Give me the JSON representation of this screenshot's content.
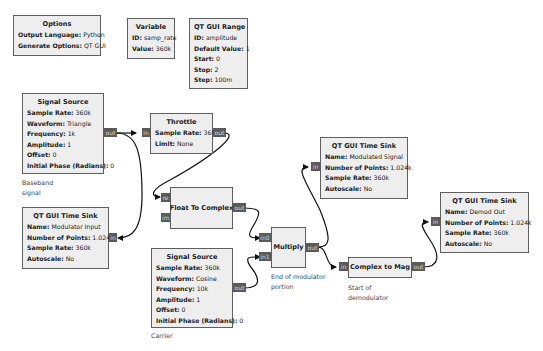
{
  "blocks": {
    "options": {
      "title": "Options",
      "params": [
        {
          "k": "Output Language:",
          "v": "Python"
        },
        {
          "k": "Generate Options:",
          "v": "QT GUI"
        }
      ]
    },
    "variable": {
      "title": "Variable",
      "params": [
        {
          "k": "ID:",
          "v": "samp_rate"
        },
        {
          "k": "Value:",
          "v": "360k"
        }
      ]
    },
    "qt_gui_range": {
      "title": "QT GUI Range",
      "params": [
        {
          "k": "ID:",
          "v": "amplitude"
        },
        {
          "k": "Default Value:",
          "v": "1"
        },
        {
          "k": "Start:",
          "v": "0"
        },
        {
          "k": "Stop:",
          "v": "2"
        },
        {
          "k": "Step:",
          "v": "100m"
        }
      ]
    },
    "signal_source_baseband": {
      "title": "Signal Source",
      "params": [
        {
          "k": "Sample Rate:",
          "v": "360k"
        },
        {
          "k": "Waveform:",
          "v": "Triangle"
        },
        {
          "k": "Frequency:",
          "v": "1k"
        },
        {
          "k": "Amplitude:",
          "v": "1"
        },
        {
          "k": "Offset:",
          "v": "0"
        },
        {
          "k": "Initial Phase (Radians):",
          "v": "0"
        }
      ],
      "ports": {
        "out": "out"
      },
      "comment": [
        "Baseband",
        "signal"
      ]
    },
    "throttle": {
      "title": "Throttle",
      "params": [
        {
          "k": "Sample Rate:",
          "v": "360k"
        },
        {
          "k": "Limit:",
          "v": "None"
        }
      ],
      "ports": {
        "in": "in",
        "out": "out"
      }
    },
    "time_sink_modulator_input": {
      "title": "QT GUI Time Sink",
      "params": [
        {
          "k": "Name:",
          "v": "Modulator Input"
        },
        {
          "k": "Number of Points:",
          "v": "1.024k"
        },
        {
          "k": "Sample Rate:",
          "v": "360k"
        },
        {
          "k": "Autoscale:",
          "v": "No"
        }
      ],
      "ports": {
        "in": "in"
      }
    },
    "float_to_complex": {
      "title": "Float To Complex",
      "ports": {
        "re": "re",
        "im": "im",
        "out": "out"
      }
    },
    "signal_source_carrier": {
      "title": "Signal Source",
      "params": [
        {
          "k": "Sample Rate:",
          "v": "360k"
        },
        {
          "k": "Waveform:",
          "v": "Cosine"
        },
        {
          "k": "Frequency:",
          "v": "10k"
        },
        {
          "k": "Amplitude:",
          "v": "1"
        },
        {
          "k": "Offset:",
          "v": "0"
        },
        {
          "k": "Initial Phase (Radians):",
          "v": "0"
        }
      ],
      "ports": {
        "out": "out"
      },
      "comment": [
        "Carrier"
      ]
    },
    "multiply": {
      "title": "Multiply",
      "ports": {
        "in0": "in0",
        "in1": "in1",
        "out": "out"
      },
      "comment": [
        "End of modulator",
        "portion"
      ]
    },
    "time_sink_modulated_signal": {
      "title": "QT GUI Time Sink",
      "params": [
        {
          "k": "Name:",
          "v": "Modulated Signal"
        },
        {
          "k": "Number of Points:",
          "v": "1.024k"
        },
        {
          "k": "Sample Rate:",
          "v": "360k"
        },
        {
          "k": "Autoscale:",
          "v": "No"
        }
      ],
      "ports": {
        "in": "in"
      }
    },
    "complex_to_mag": {
      "title": "Complex to Mag",
      "ports": {
        "in": "in",
        "out": "out"
      },
      "comment": [
        "Start of",
        "demodulator"
      ]
    },
    "time_sink_demod_out": {
      "title": "QT GUI Time Sink",
      "params": [
        {
          "k": "Name:",
          "v": "Demod Out"
        },
        {
          "k": "Number of Points:",
          "v": "1.024k"
        },
        {
          "k": "Sample Rate:",
          "v": "360k"
        },
        {
          "k": "Autoscale:",
          "v": "No"
        }
      ],
      "ports": {
        "in": "in"
      }
    }
  },
  "connections": [
    {
      "from": "signal_source_baseband.out",
      "to": "throttle.in"
    },
    {
      "from": "signal_source_baseband.out",
      "to": "time_sink_modulator_input.in"
    },
    {
      "from": "throttle.out",
      "to": "float_to_complex.re"
    },
    {
      "from": "float_to_complex.out",
      "to": "multiply.in0"
    },
    {
      "from": "signal_source_carrier.out",
      "to": "multiply.in1"
    },
    {
      "from": "multiply.out",
      "to": "time_sink_modulated_signal.in"
    },
    {
      "from": "multiply.out",
      "to": "complex_to_mag.in"
    },
    {
      "from": "complex_to_mag.out",
      "to": "time_sink_demod_out.in"
    }
  ],
  "colors": {
    "block_fill": "#eeeeee",
    "block_border": "#5f5f5f",
    "port_fill": "#5a5a5a",
    "port_text": "#d8d8d8",
    "wire": "#111111",
    "background": "#ffffff"
  }
}
